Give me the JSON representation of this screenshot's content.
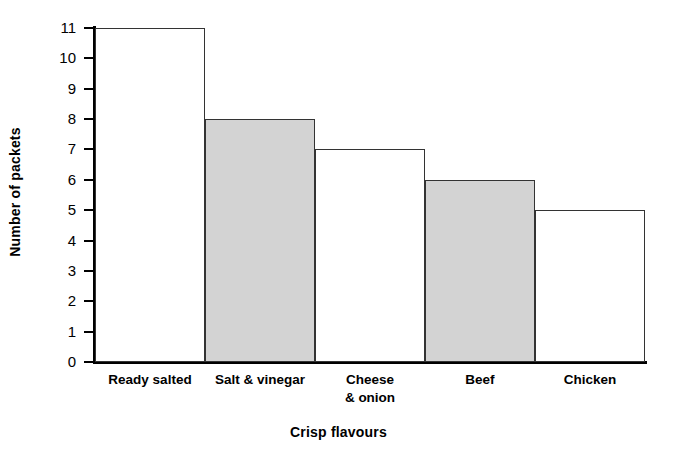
{
  "chart_data": {
    "type": "bar",
    "title": "",
    "subtitle": "",
    "xlabel": "Crisp flavours",
    "ylabel": "Number of packets",
    "categories": [
      "Ready salted",
      "Salt & vinegar",
      "Cheese\n& onion",
      "Beef",
      "Chicken"
    ],
    "values": [
      11,
      8,
      7,
      6,
      5
    ],
    "bar_fills": [
      "white",
      "gray",
      "white",
      "gray",
      "white"
    ],
    "ylim": [
      0,
      11
    ],
    "yticks": [
      0,
      1,
      2,
      3,
      4,
      5,
      6,
      7,
      8,
      9,
      10,
      11
    ],
    "ytick_labels": [
      "0",
      "1",
      "2",
      "3",
      "4",
      "5",
      "6",
      "7",
      "8",
      "9",
      "10",
      "11"
    ],
    "grid": false,
    "legend": "none",
    "colors": {
      "bar_gray": "#d3d3d3",
      "bar_white": "#ffffff",
      "bar_outline": "#333333",
      "axis": "#000000",
      "text": "#000000",
      "background": "#ffffff"
    }
  }
}
